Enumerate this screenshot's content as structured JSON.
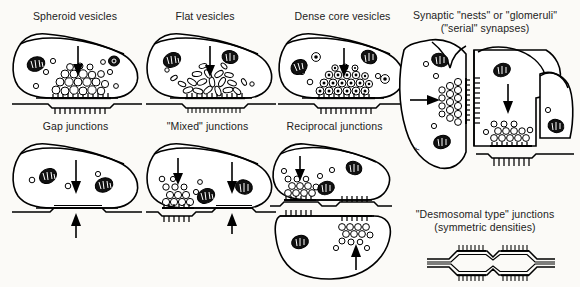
{
  "figure": {
    "background_color": "#fbfaf7",
    "ink_color": "#000000"
  },
  "panels": [
    {
      "id": "spheroid-vesicles",
      "caption": "Spheroid vesicles",
      "vesicle_shape": "round",
      "vesicle_count": 26,
      "mitochondria": 2,
      "arrows": [
        "down"
      ],
      "junction": "asymmetric-chemical"
    },
    {
      "id": "flat-vesicles",
      "caption": "Flat vesicles",
      "vesicle_shape": "flattened-ellipse",
      "vesicle_count": 22,
      "mitochondria": 2,
      "arrows": [
        "down"
      ],
      "junction": "asymmetric-chemical"
    },
    {
      "id": "dense-core-vesicles",
      "caption": "Dense core vesicles",
      "vesicle_shape": "round-with-dense-core",
      "vesicle_count": 24,
      "mitochondria": 2,
      "arrows": [
        "down"
      ],
      "junction": "asymmetric-chemical"
    },
    {
      "id": "gap-junctions",
      "caption": "Gap junctions",
      "vesicle_shape": "none-at-junction",
      "vesicle_count": 3,
      "mitochondria": 2,
      "arrows": [
        "down",
        "up"
      ],
      "junction": "gap"
    },
    {
      "id": "mixed-junctions",
      "caption": "\"Mixed\" junctions",
      "vesicle_shape": "round",
      "vesicle_count": 14,
      "mitochondria": 2,
      "arrows": [
        "down",
        "down",
        "up"
      ],
      "junction": "chemical-plus-gap"
    },
    {
      "id": "reciprocal-junctions",
      "caption": "Reciprocal junctions",
      "vesicle_shape": "round",
      "vesicle_count": 28,
      "mitochondria": 3,
      "arrows": [
        "down",
        "up"
      ],
      "junction": "reciprocal-pair"
    }
  ],
  "glomeruli": {
    "caption_line1": "Synaptic \"nests\" or \"glomeruli\"",
    "caption_line2": "(\"serial\" synapses)",
    "arrows": [
      "right",
      "down"
    ],
    "profiles": 3,
    "junction": "serial-chemical"
  },
  "desmosomal": {
    "caption_line1": "\"Desmosomal type\" junctions",
    "caption_line2": "(symmetric densities)",
    "density_patches": 4,
    "junction": "symmetric"
  }
}
